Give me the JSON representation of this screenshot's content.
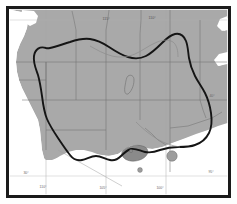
{
  "figure": {
    "frame": {
      "style": "black rectangular border",
      "color": "#1a1a1a"
    }
  },
  "legend_colors": {
    "land_shaded": "#a9a9a9",
    "land_unshaded": "#ffffff",
    "dark_region": "#8a8a8a",
    "contour_line": "#151515",
    "state_border": "#707070",
    "graticule": "#9a9a9a",
    "marker": "#9d9d9d",
    "frame": "#1a1a1a"
  },
  "graticule": {
    "top_labels": [
      {
        "text": "115°",
        "x": 106,
        "y": 20
      },
      {
        "text": "110°",
        "x": 152,
        "y": 19
      }
    ],
    "bottom_labels": [
      {
        "text": "30°",
        "x": 26,
        "y": 174
      },
      {
        "text": "110°",
        "x": 43,
        "y": 188
      },
      {
        "text": "105°",
        "x": 103,
        "y": 189
      },
      {
        "text": "100°",
        "x": 160,
        "y": 189
      },
      {
        "text": "95°",
        "x": 211,
        "y": 173
      }
    ],
    "right_labels": [
      {
        "text": "40°",
        "x": 212,
        "y": 97
      }
    ]
  },
  "features": {
    "contour_label": "thick closed contour",
    "dark_region_label": "dark shaded basin",
    "markers": [
      {
        "name": "marker-1",
        "cx": 172,
        "cy": 156,
        "r": 5.2
      },
      {
        "name": "marker-2",
        "cx": 140,
        "cy": 170,
        "r": 2.4
      },
      {
        "name": "marker-3",
        "cx": 131,
        "cy": 151,
        "r": 1.6
      }
    ]
  }
}
